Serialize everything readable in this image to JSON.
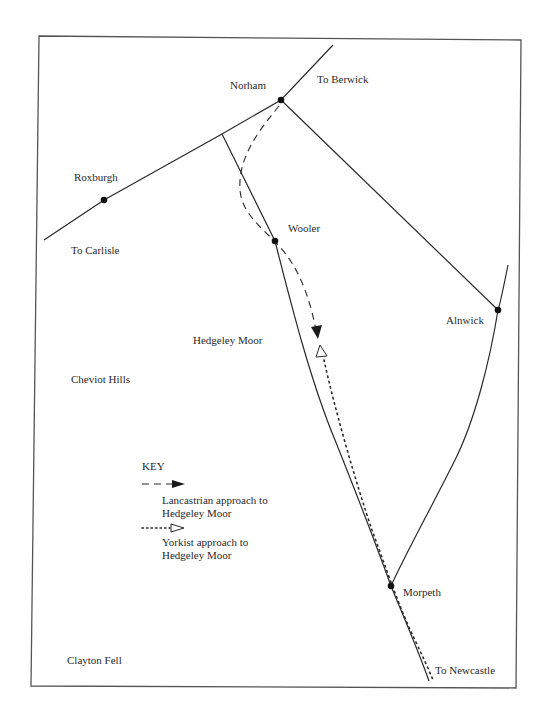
{
  "map": {
    "places": [
      {
        "name": "Norham",
        "x": 281,
        "y": 100,
        "label_x": 230,
        "label_y": 79
      },
      {
        "name": "Roxburgh",
        "x": 104,
        "y": 200,
        "label_x": 74,
        "label_y": 171
      },
      {
        "name": "Wooler",
        "x": 275,
        "y": 241,
        "label_x": 288,
        "label_y": 222
      },
      {
        "name": "Alnwick",
        "x": 498,
        "y": 310,
        "label_x": 446,
        "label_y": 314
      },
      {
        "name": "Morpeth",
        "x": 391,
        "y": 586,
        "label_x": 403,
        "label_y": 586
      }
    ],
    "directions": {
      "berwick": "To Berwick",
      "carlisle": "To Carlisle",
      "newcastle": "To Newcastle"
    },
    "regions": {
      "hedgeley_moor": "Hedgeley Moor",
      "cheviot_hills": "Cheviot Hills",
      "clayton_fell": "Clayton Fell"
    },
    "colors": {
      "ink": "#2a2a2a",
      "frame": "#555555",
      "background": "#ffffff"
    }
  },
  "key": {
    "title": "KEY",
    "lancastrian_line1": "Lancastrian approach to",
    "lancastrian_line2": "Hedgeley Moor",
    "yorkist_line1": "Yorkist approach to",
    "yorkist_line2": "Hedgeley Moor"
  }
}
